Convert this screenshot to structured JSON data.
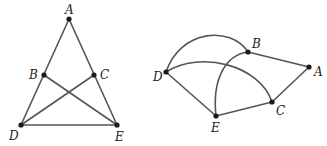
{
  "graphs": [
    {
      "name": "left-graph",
      "vertices": [
        "A",
        "B",
        "C",
        "D",
        "E"
      ],
      "edges": [
        [
          "A",
          "B"
        ],
        [
          "B",
          "D"
        ],
        [
          "A",
          "C"
        ],
        [
          "C",
          "E"
        ],
        [
          "B",
          "E"
        ],
        [
          "C",
          "D"
        ],
        [
          "D",
          "E"
        ]
      ],
      "labels": {
        "A": "A",
        "B": "B",
        "C": "C",
        "D": "D",
        "E": "E"
      }
    },
    {
      "name": "right-graph",
      "vertices": [
        "A",
        "B",
        "C",
        "D",
        "E"
      ],
      "edges": [
        [
          "B",
          "A"
        ],
        [
          "A",
          "C"
        ],
        [
          "C",
          "E"
        ],
        [
          "E",
          "D"
        ],
        [
          "D",
          "B"
        ],
        [
          "D",
          "C"
        ],
        [
          "E",
          "B"
        ]
      ],
      "labels": {
        "A": "A",
        "B": "B",
        "C": "C",
        "D": "D",
        "E": "E"
      }
    }
  ]
}
